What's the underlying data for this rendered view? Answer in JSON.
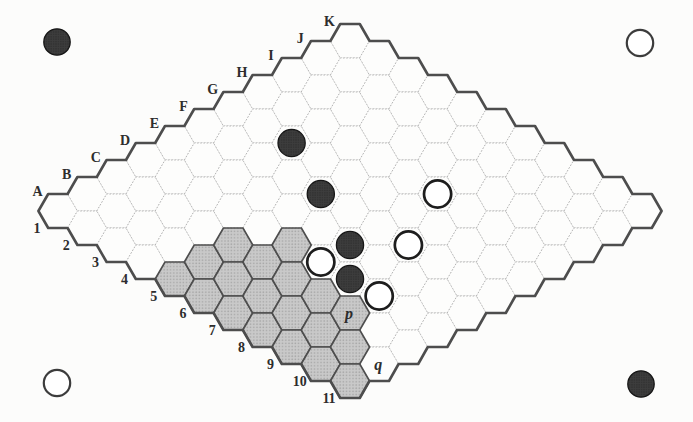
{
  "figure": {
    "type": "hex-board-diagram",
    "board_size": "11x11",
    "columns": [
      "A",
      "B",
      "C",
      "D",
      "E",
      "F",
      "G",
      "H",
      "I",
      "J",
      "K"
    ],
    "rows": [
      "1",
      "2",
      "3",
      "4",
      "5",
      "6",
      "7",
      "8",
      "9",
      "10",
      "11"
    ],
    "shaded_cells": [
      "A5",
      "B5",
      "C5",
      "A6",
      "B6",
      "C6",
      "D6",
      "A7",
      "B7",
      "C7",
      "A8",
      "B8",
      "C8",
      "A9",
      "B9",
      "C9",
      "A10",
      "B10",
      "A11"
    ],
    "black_stones": [
      "G3",
      "F5",
      "E7",
      "D8"
    ],
    "white_stones": [
      "H7",
      "F8",
      "D7",
      "D9"
    ],
    "cell_labels": [
      {
        "cell": "C9",
        "text": "p"
      },
      {
        "cell": "B11",
        "text": "q"
      }
    ],
    "corner_markers": [
      {
        "position": "top-left",
        "player": "black",
        "x": 57,
        "y": 42
      },
      {
        "position": "top-right",
        "player": "white",
        "x": 640,
        "y": 43
      },
      {
        "position": "bottom-left",
        "player": "white",
        "x": 57,
        "y": 383
      },
      {
        "position": "bottom-right",
        "player": "black",
        "x": 641,
        "y": 384
      }
    ],
    "geometry": {
      "origin_x": 58,
      "origin_y": 211,
      "step_x": 29.2,
      "step_y": 17,
      "hex_radius": 19.6,
      "stone_radius": 13.6,
      "marker_radius": 13.2,
      "label_font_size": 14,
      "cell_label_font_size": 16
    },
    "colors": {
      "page_bg": "#fcfcfb",
      "cell_fill": "#fdfdfc",
      "cell_stroke": "#b0b0b0",
      "shaded_fill": "#c9c9c9",
      "shaded_dot": "#a6a6a6",
      "shaded_stroke": "#4e4e4e",
      "outline": "#4d4d4d",
      "black_stone": "#3d3d3d",
      "black_stone_dot": "#232323",
      "black_stone_stroke": "#161616",
      "white_stone_fill": "#ffffff",
      "stone_ring": "#1d1d1d",
      "marker_ring": "#3c3c3c",
      "label_color": "#2d2d2d"
    }
  }
}
